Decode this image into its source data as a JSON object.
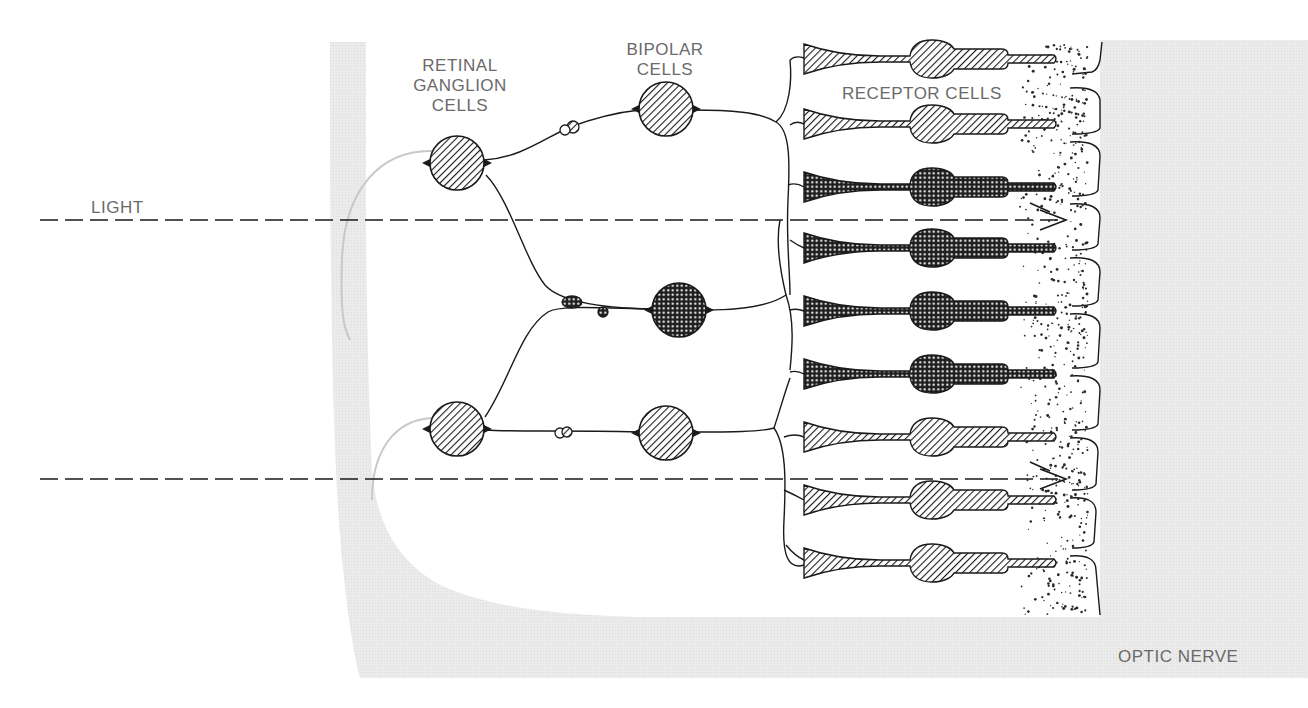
{
  "figure": {
    "type": "retina-cross-section-diagram",
    "colors": {
      "background": "#ffffff",
      "tissue_shade": "#e9e9e9",
      "ink": "#1a1a1a",
      "label_text": "#6a6a6a",
      "pigment_dots": "#2a2a2a"
    }
  },
  "labels": {
    "ganglion_line1": "RETINAL",
    "ganglion_line2": "GANGLION",
    "ganglion_line3": "CELLS",
    "bipolar_line1": "BIPOLAR",
    "bipolar_line2": "CELLS",
    "receptor": "RECEPTOR CELLS",
    "light": "LIGHT",
    "optic_nerve": "OPTIC NERVE"
  },
  "light_rays": [
    {
      "y": 220,
      "x_start": 40,
      "x_end": 1068,
      "labeled": true
    },
    {
      "y": 479,
      "x_start": 40,
      "x_end": 1068,
      "labeled": false
    }
  ],
  "ganglion_cells": [
    {
      "cx": 457,
      "cy": 163,
      "r": 27,
      "fill": "hatch"
    },
    {
      "cx": 457,
      "cy": 429,
      "r": 27,
      "fill": "hatch"
    }
  ],
  "bipolar_cells": [
    {
      "cx": 666,
      "cy": 109,
      "r": 27,
      "fill": "hatch"
    },
    {
      "cx": 679,
      "cy": 310,
      "r": 27,
      "fill": "crosshatch"
    },
    {
      "cx": 666,
      "cy": 433,
      "r": 27,
      "fill": "hatch"
    }
  ],
  "receptor_cells": [
    {
      "y": 59,
      "fill": "hatch"
    },
    {
      "y": 124,
      "fill": "hatch"
    },
    {
      "y": 187,
      "fill": "crosshatch"
    },
    {
      "y": 248,
      "fill": "crosshatch"
    },
    {
      "y": 311,
      "fill": "crosshatch"
    },
    {
      "y": 374,
      "fill": "crosshatch"
    },
    {
      "y": 437,
      "fill": "hatch"
    },
    {
      "y": 500,
      "fill": "hatch"
    },
    {
      "y": 563,
      "fill": "hatch"
    }
  ]
}
